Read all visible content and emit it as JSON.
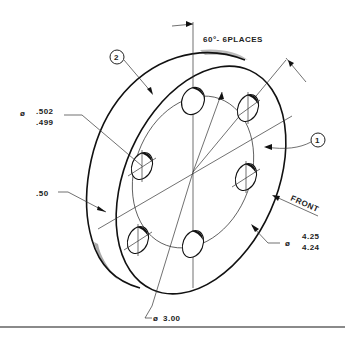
{
  "drawing": {
    "title": "Isometric view of flange disk with 6-hole bolt circle",
    "angle_note": "60°- 6PLACES",
    "hole_diameter": {
      "symbol": "ø",
      "upper": ".502",
      "lower": ".499"
    },
    "thickness": ".50",
    "bolt_circle_diameter": {
      "symbol": "ø",
      "value": "3.00"
    },
    "outer_diameter": {
      "symbol": "ø",
      "upper": "4.25",
      "lower": "4.24"
    },
    "view_label": "FRONT",
    "balloons": [
      {
        "number": "1"
      },
      {
        "number": "2"
      }
    ],
    "hole_count": 6
  }
}
